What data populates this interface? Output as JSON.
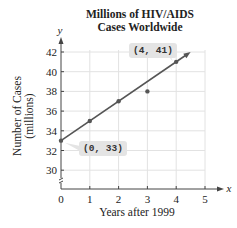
{
  "chart_data": {
    "type": "line",
    "title_lines": [
      "Millions of HIV/AIDS",
      "Cases Worldwide"
    ],
    "xlabel": "Years after 1999",
    "ylabel": "Number of Cases (millions)",
    "ylabel_lines": [
      "Number of Cases",
      "(millions)"
    ],
    "x_axis_symbol": "x",
    "y_axis_symbol": "y",
    "xlim": [
      0,
      5
    ],
    "ylim": [
      30,
      42
    ],
    "x_ticks": [
      "0",
      "1",
      "2",
      "3",
      "4",
      "5"
    ],
    "y_ticks": [
      "30",
      "32",
      "34",
      "36",
      "38",
      "40",
      "42"
    ],
    "grid": true,
    "y_axis_break": true,
    "series": [
      {
        "name": "line of best fit",
        "type": "line",
        "x": [
          0,
          1,
          2,
          4
        ],
        "y": [
          33,
          35,
          37,
          41
        ],
        "extends_with_arrow_to": [
          4.5,
          42
        ]
      },
      {
        "name": "data point off line",
        "type": "scatter",
        "x": [
          3
        ],
        "y": [
          38
        ]
      }
    ],
    "annotations": [
      {
        "text": "(0, 33)",
        "x": 0,
        "y": 33
      },
      {
        "text": "(4, 41)",
        "x": 4,
        "y": 41
      }
    ],
    "colors": {
      "line": "#555555",
      "grid": "#e2e2e2",
      "axis": "#444444",
      "callout_bg": "#e4e4e4"
    }
  }
}
